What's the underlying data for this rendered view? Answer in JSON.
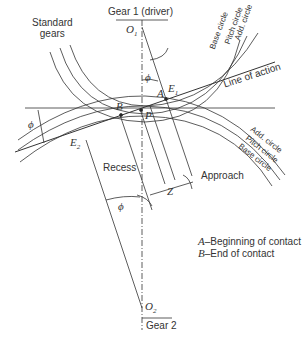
{
  "labels": {
    "standard_gears": "Standard\ngears",
    "gear1": "Gear 1 (driver)",
    "gear2": "Gear 2",
    "o1": "O",
    "o1_sub": "1",
    "o2": "O",
    "o2_sub": "2",
    "phi": "ϕ",
    "point_a": "A",
    "point_b": "B",
    "point_p": "P",
    "point_e1": "E",
    "e1_sub": "1",
    "point_e2": "E",
    "e2_sub": "2",
    "line_of_action": "Line of action",
    "recess": "Recess",
    "approach": "Approach",
    "z": "Z",
    "gear1_circles": [
      "Base circle",
      "Pitch circle",
      "Add. circle"
    ],
    "gear2_circles": [
      "Add. circle",
      "Pitch circle",
      "Base circle"
    ],
    "legend_a_key": "A",
    "legend_a_text": "–Beginning of contact",
    "legend_b_key": "B",
    "legend_b_text": "–End of contact"
  }
}
